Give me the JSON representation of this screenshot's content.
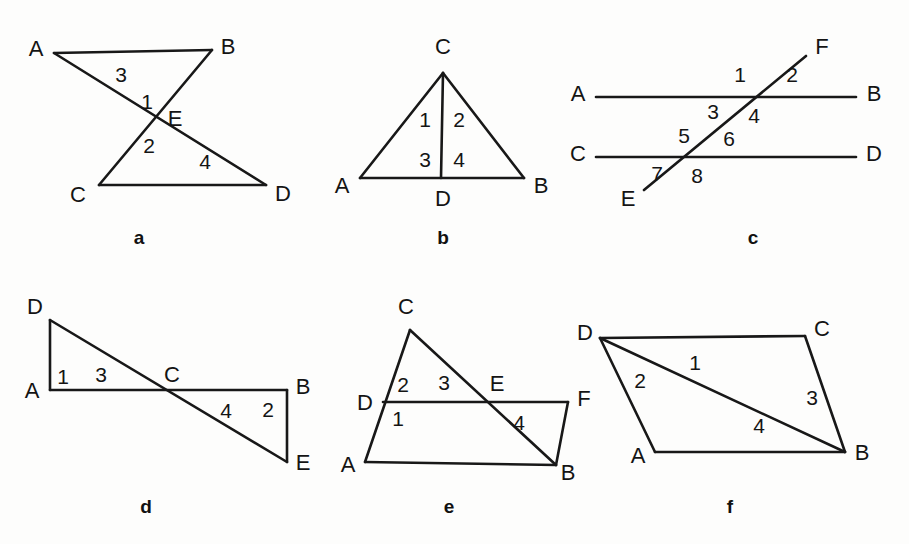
{
  "document": {
    "kind": "geometry-figure-sheet",
    "description": "Six labeled plane-geometry figures arranged in two rows of three",
    "background_color": "#fdfdfc",
    "ink_color": "#181818",
    "width": 909,
    "height": 544
  },
  "figures": [
    {
      "id": "a",
      "caption": "a",
      "caption_pos": [
        139,
        239
      ],
      "name": "bowtie-triangles-abe-cde",
      "segments": [
        {
          "name": "segment-AB",
          "from": [
            54,
            53
          ],
          "to": [
            212,
            50
          ]
        },
        {
          "name": "segment-AD",
          "from": [
            54,
            53
          ],
          "to": [
            266,
            185
          ]
        },
        {
          "name": "segment-BC",
          "from": [
            212,
            50
          ],
          "to": [
            99,
            185
          ]
        },
        {
          "name": "segment-CD",
          "from": [
            99,
            185
          ],
          "to": [
            266,
            185
          ]
        }
      ],
      "vertices": [
        {
          "name": "vertex-A",
          "label": "A",
          "pos": [
            36,
            50
          ]
        },
        {
          "name": "vertex-B",
          "label": "B",
          "pos": [
            228,
            48
          ]
        },
        {
          "name": "vertex-E",
          "label": "E",
          "pos": [
            175,
            120
          ]
        },
        {
          "name": "vertex-C",
          "label": "C",
          "pos": [
            78,
            196
          ]
        },
        {
          "name": "vertex-D",
          "label": "D",
          "pos": [
            283,
            195
          ]
        }
      ],
      "angles": [
        {
          "name": "angle-3",
          "label": "3",
          "pos": [
            121,
            76
          ]
        },
        {
          "name": "angle-1",
          "label": "1",
          "pos": [
            147,
            103
          ]
        },
        {
          "name": "angle-2",
          "label": "2",
          "pos": [
            149,
            147
          ]
        },
        {
          "name": "angle-4",
          "label": "4",
          "pos": [
            205,
            163
          ]
        }
      ]
    },
    {
      "id": "b",
      "caption": "b",
      "caption_pos": [
        443,
        239
      ],
      "name": "triangle-abc-with-cevian-cd",
      "segments": [
        {
          "name": "segment-AC",
          "from": [
            360,
            178
          ],
          "to": [
            443,
            73
          ]
        },
        {
          "name": "segment-CB",
          "from": [
            443,
            73
          ],
          "to": [
            524,
            178
          ]
        },
        {
          "name": "segment-AB",
          "from": [
            360,
            178
          ],
          "to": [
            524,
            178
          ]
        },
        {
          "name": "segment-CD",
          "from": [
            443,
            73
          ],
          "to": [
            441,
            178
          ]
        }
      ],
      "vertices": [
        {
          "name": "vertex-C",
          "label": "C",
          "pos": [
            443,
            48
          ]
        },
        {
          "name": "vertex-A",
          "label": "A",
          "pos": [
            342,
            187
          ]
        },
        {
          "name": "vertex-B",
          "label": "B",
          "pos": [
            541,
            187
          ]
        },
        {
          "name": "vertex-D",
          "label": "D",
          "pos": [
            443,
            200
          ]
        }
      ],
      "angles": [
        {
          "name": "angle-1",
          "label": "1",
          "pos": [
            425,
            121
          ]
        },
        {
          "name": "angle-2",
          "label": "2",
          "pos": [
            459,
            121
          ]
        },
        {
          "name": "angle-3",
          "label": "3",
          "pos": [
            425,
            161
          ]
        },
        {
          "name": "angle-4",
          "label": "4",
          "pos": [
            459,
            161
          ]
        }
      ]
    },
    {
      "id": "c",
      "caption": "c",
      "caption_pos": [
        753,
        239
      ],
      "name": "parallel-lines-ab-cd-cut-by-transversal-ef",
      "segments": [
        {
          "name": "line-AB",
          "from": [
            596,
            97
          ],
          "to": [
            856,
            97
          ]
        },
        {
          "name": "line-CD",
          "from": [
            596,
            157
          ],
          "to": [
            856,
            157
          ]
        },
        {
          "name": "line-EF",
          "from": [
            644,
            190
          ],
          "to": [
            806,
            56
          ]
        }
      ],
      "vertices": [
        {
          "name": "vertex-A",
          "label": "A",
          "pos": [
            578,
            95
          ]
        },
        {
          "name": "vertex-B",
          "label": "B",
          "pos": [
            874,
            95
          ]
        },
        {
          "name": "vertex-C",
          "label": "C",
          "pos": [
            578,
            155
          ]
        },
        {
          "name": "vertex-D",
          "label": "D",
          "pos": [
            874,
            155
          ]
        },
        {
          "name": "vertex-E",
          "label": "E",
          "pos": [
            628,
            200
          ]
        },
        {
          "name": "vertex-F",
          "label": "F",
          "pos": [
            822,
            48
          ]
        }
      ],
      "angles": [
        {
          "name": "angle-1",
          "label": "1",
          "pos": [
            740,
            76
          ]
        },
        {
          "name": "angle-2",
          "label": "2",
          "pos": [
            792,
            76
          ]
        },
        {
          "name": "angle-3",
          "label": "3",
          "pos": [
            713,
            113
          ]
        },
        {
          "name": "angle-4",
          "label": "4",
          "pos": [
            754,
            117
          ]
        },
        {
          "name": "angle-5",
          "label": "5",
          "pos": [
            684,
            137
          ]
        },
        {
          "name": "angle-6",
          "label": "6",
          "pos": [
            729,
            140
          ]
        },
        {
          "name": "angle-7",
          "label": "7",
          "pos": [
            657,
            175
          ]
        },
        {
          "name": "angle-8",
          "label": "8",
          "pos": [
            697,
            177
          ]
        }
      ]
    },
    {
      "id": "d",
      "caption": "d",
      "caption_pos": [
        146,
        508
      ],
      "name": "triangles-acd-and-bce-crossing-at-c",
      "segments": [
        {
          "name": "segment-DA",
          "from": [
            50,
            320
          ],
          "to": [
            50,
            390
          ]
        },
        {
          "name": "segment-DE",
          "from": [
            50,
            320
          ],
          "to": [
            287,
            462
          ]
        },
        {
          "name": "segment-AB",
          "from": [
            50,
            390
          ],
          "to": [
            287,
            390
          ]
        },
        {
          "name": "segment-BE",
          "from": [
            287,
            390
          ],
          "to": [
            287,
            462
          ]
        }
      ],
      "vertices": [
        {
          "name": "vertex-D",
          "label": "D",
          "pos": [
            35,
            308
          ]
        },
        {
          "name": "vertex-A",
          "label": "A",
          "pos": [
            32,
            392
          ]
        },
        {
          "name": "vertex-C",
          "label": "C",
          "pos": [
            172,
            376
          ]
        },
        {
          "name": "vertex-B",
          "label": "B",
          "pos": [
            303,
            388
          ]
        },
        {
          "name": "vertex-E",
          "label": "E",
          "pos": [
            303,
            464
          ]
        }
      ],
      "angles": [
        {
          "name": "angle-1",
          "label": "1",
          "pos": [
            63,
            378
          ]
        },
        {
          "name": "angle-3",
          "label": "3",
          "pos": [
            101,
            376
          ]
        },
        {
          "name": "angle-4",
          "label": "4",
          "pos": [
            226,
            412
          ]
        },
        {
          "name": "angle-2",
          "label": "2",
          "pos": [
            268,
            411
          ]
        }
      ]
    },
    {
      "id": "e",
      "caption": "e",
      "caption_pos": [
        449,
        508
      ],
      "name": "parallelogram-adfb-with-triangle-cab",
      "segments": [
        {
          "name": "segment-AC",
          "from": [
            365,
            462
          ],
          "to": [
            410,
            330
          ]
        },
        {
          "name": "segment-CB",
          "from": [
            410,
            330
          ],
          "to": [
            556,
            465
          ]
        },
        {
          "name": "segment-AB",
          "from": [
            365,
            462
          ],
          "to": [
            556,
            465
          ]
        },
        {
          "name": "segment-DF",
          "from": [
            383,
            402
          ],
          "to": [
            568,
            402
          ]
        },
        {
          "name": "segment-FB",
          "from": [
            568,
            402
          ],
          "to": [
            556,
            465
          ]
        }
      ],
      "vertices": [
        {
          "name": "vertex-C",
          "label": "C",
          "pos": [
            406,
            308
          ]
        },
        {
          "name": "vertex-D",
          "label": "D",
          "pos": [
            365,
            404
          ]
        },
        {
          "name": "vertex-E",
          "label": "E",
          "pos": [
            497,
            385
          ]
        },
        {
          "name": "vertex-F",
          "label": "F",
          "pos": [
            584,
            400
          ]
        },
        {
          "name": "vertex-A",
          "label": "A",
          "pos": [
            348,
            466
          ]
        },
        {
          "name": "vertex-B",
          "label": "B",
          "pos": [
            568,
            474
          ]
        }
      ],
      "angles": [
        {
          "name": "angle-2",
          "label": "2",
          "pos": [
            403,
            386
          ]
        },
        {
          "name": "angle-3",
          "label": "3",
          "pos": [
            444,
            384
          ]
        },
        {
          "name": "angle-1",
          "label": "1",
          "pos": [
            398,
            420
          ]
        },
        {
          "name": "angle-4",
          "label": "4",
          "pos": [
            519,
            424
          ]
        }
      ]
    },
    {
      "id": "f",
      "caption": "f",
      "caption_pos": [
        730,
        508
      ],
      "name": "parallelogram-abcd-with-diagonal-db",
      "segments": [
        {
          "name": "segment-DC",
          "from": [
            600,
            338
          ],
          "to": [
            805,
            336
          ]
        },
        {
          "name": "segment-CB",
          "from": [
            805,
            336
          ],
          "to": [
            845,
            452
          ]
        },
        {
          "name": "segment-DA",
          "from": [
            600,
            338
          ],
          "to": [
            655,
            452
          ]
        },
        {
          "name": "segment-AB",
          "from": [
            655,
            452
          ],
          "to": [
            845,
            452
          ]
        },
        {
          "name": "diagonal-DB",
          "from": [
            600,
            338
          ],
          "to": [
            845,
            452
          ]
        }
      ],
      "vertices": [
        {
          "name": "vertex-D",
          "label": "D",
          "pos": [
            585,
            334
          ]
        },
        {
          "name": "vertex-C",
          "label": "C",
          "pos": [
            822,
            330
          ]
        },
        {
          "name": "vertex-A",
          "label": "A",
          "pos": [
            638,
            457
          ]
        },
        {
          "name": "vertex-B",
          "label": "B",
          "pos": [
            862,
            454
          ]
        }
      ],
      "angles": [
        {
          "name": "angle-1",
          "label": "1",
          "pos": [
            695,
            364
          ]
        },
        {
          "name": "angle-2",
          "label": "2",
          "pos": [
            640,
            382
          ]
        },
        {
          "name": "angle-3",
          "label": "3",
          "pos": [
            812,
            399
          ]
        },
        {
          "name": "angle-4",
          "label": "4",
          "pos": [
            759,
            427
          ]
        }
      ]
    }
  ]
}
